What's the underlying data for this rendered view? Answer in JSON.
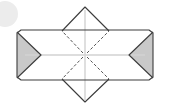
{
  "canvas": {
    "width": 170,
    "height": 109,
    "background": "#ffffff"
  },
  "figure": {
    "name": "folded-envelope-diagram",
    "stroke_color": "#3c3c3c",
    "stroke_width": "1",
    "shade_fill": "#c9c9c9",
    "shade_fill_light": "#dcdcdc",
    "axis_color": "#d2d2d2",
    "dash_color": "#555555",
    "dash_pattern": "3 2",
    "body": {
      "label": "envelope-body",
      "left": 17,
      "right": 153,
      "top": 31,
      "bottom": 79,
      "corner_cut": 4
    },
    "left_notch": {
      "label": "left-chevron-notch",
      "apex_x": 41,
      "apex_y": 55,
      "fill": "#c9c9c9"
    },
    "right_notch": {
      "label": "right-chevron-notch",
      "apex_x": 129,
      "apex_y": 55,
      "fill": "#c9c9c9"
    },
    "top_flap": {
      "label": "top-triangular-flap",
      "apex_x": 85,
      "apex_y": 7,
      "base_left_x": 62,
      "base_right_x": 109,
      "base_y": 31
    },
    "bottom_flap": {
      "label": "bottom-triangular-flap",
      "apex_x": 85,
      "apex_y": 102,
      "base_left_x": 62,
      "base_right_x": 109,
      "base_y": 79
    },
    "center_point": {
      "x": 85,
      "y": 55
    },
    "horizontal_axis": {
      "label": "horizontal-center-axis",
      "x1": 25,
      "x2": 145,
      "y": 55
    },
    "vertical_axis": {
      "label": "vertical-center-axis",
      "x": 85,
      "y1": 10,
      "y2": 100
    },
    "fold_lines": [
      {
        "name": "fold-upper-left",
        "x1": 85,
        "y1": 55,
        "x2": 62,
        "y2": 31
      },
      {
        "name": "fold-upper-right",
        "x1": 85,
        "y1": 55,
        "x2": 109,
        "y2": 31
      },
      {
        "name": "fold-lower-left",
        "x1": 85,
        "y1": 55,
        "x2": 62,
        "y2": 79
      },
      {
        "name": "fold-lower-right",
        "x1": 85,
        "y1": 55,
        "x2": 109,
        "y2": 79
      }
    ],
    "corner_badge": {
      "label": "corner-circle-mark",
      "cx": 5,
      "cy": 14,
      "r": 13,
      "fill": "#ececec"
    }
  }
}
